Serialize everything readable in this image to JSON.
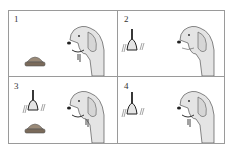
{
  "diagram": {
    "panels": [
      {
        "number": "1",
        "elements": [
          "food-bowl",
          "dog-salivating"
        ]
      },
      {
        "number": "2",
        "elements": [
          "bell-ringing",
          "dog"
        ]
      },
      {
        "number": "3",
        "elements": [
          "bell-ringing",
          "food-bowl",
          "dog-salivating"
        ]
      },
      {
        "number": "4",
        "elements": [
          "bell-ringing",
          "dog-salivating"
        ]
      }
    ],
    "colors": {
      "dog_fill": "#e4e4e4",
      "outline": "#555555",
      "bowl": "#8a7a6a",
      "border": "#9a9a9a"
    }
  }
}
